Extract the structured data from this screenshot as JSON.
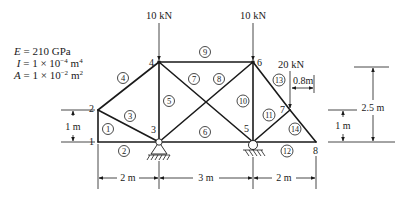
{
  "material_properties": {
    "E": {
      "symbol": "E",
      "eq": " = ",
      "value": "210 GPa"
    },
    "I": {
      "symbol": "I",
      "eq": " = ",
      "value": "1 × 10",
      "exp": "−4",
      "unit": " m",
      "unit_exp": "4"
    },
    "A": {
      "symbol": "A",
      "eq": " = ",
      "value": "1 × 10",
      "exp": "−2",
      "unit": " m",
      "unit_exp": "2"
    }
  },
  "nodes": [
    {
      "id": "1",
      "label": "1"
    },
    {
      "id": "2",
      "label": "2"
    },
    {
      "id": "3",
      "label": "3"
    },
    {
      "id": "4",
      "label": "4"
    },
    {
      "id": "5",
      "label": "5"
    },
    {
      "id": "6",
      "label": "6"
    },
    {
      "id": "7",
      "label": "7"
    },
    {
      "id": "8",
      "label": "8"
    }
  ],
  "elements": [
    {
      "id": "1",
      "label": "1",
      "from": "1",
      "to": "2"
    },
    {
      "id": "2",
      "label": "2",
      "from": "1",
      "to": "3"
    },
    {
      "id": "3",
      "label": "3",
      "from": "2",
      "to": "3"
    },
    {
      "id": "4",
      "label": "4",
      "from": "2",
      "to": "4"
    },
    {
      "id": "5",
      "label": "5",
      "from": "3",
      "to": "4"
    },
    {
      "id": "6",
      "label": "6",
      "from": "3",
      "to": "5"
    },
    {
      "id": "7",
      "label": "7",
      "from": "4",
      "to": "5"
    },
    {
      "id": "8",
      "label": "8",
      "from": "3",
      "to": "6"
    },
    {
      "id": "9",
      "label": "9",
      "from": "4",
      "to": "6"
    },
    {
      "id": "10",
      "label": "10",
      "from": "5",
      "to": "6"
    },
    {
      "id": "11",
      "label": "11",
      "from": "5",
      "to": "7"
    },
    {
      "id": "12",
      "label": "12",
      "from": "5",
      "to": "8"
    },
    {
      "id": "13",
      "label": "13",
      "from": "6",
      "to": "7"
    },
    {
      "id": "14",
      "label": "14",
      "from": "7",
      "to": "8"
    }
  ],
  "loads": [
    {
      "node": "4",
      "label": "10 kN"
    },
    {
      "node": "6",
      "label": "10 kN"
    },
    {
      "node": "7",
      "label": "20 kN"
    }
  ],
  "supports": [
    {
      "node": "3",
      "type": "pin"
    },
    {
      "node": "5",
      "type": "pin"
    }
  ],
  "dimensions": {
    "left_height": "1 m",
    "right_height_small": "1 m",
    "right_height_total": "2.5 m",
    "load_offset": "0.8m",
    "span_1": "2 m",
    "span_2": "3 m",
    "span_3": "2 m"
  }
}
